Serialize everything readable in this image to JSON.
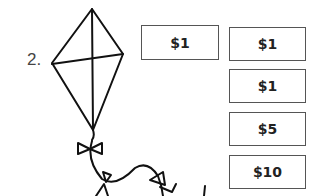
{
  "problem": {
    "number": "2."
  },
  "illustration": {
    "name": "kite-with-bow-tail"
  },
  "given_amount": {
    "label": "$1"
  },
  "options": [
    {
      "label": "$1"
    },
    {
      "label": "$1"
    },
    {
      "label": "$5"
    },
    {
      "label": "$10"
    }
  ]
}
